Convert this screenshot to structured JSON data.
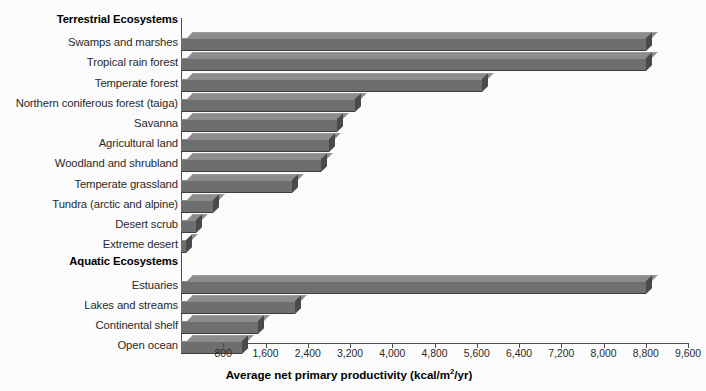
{
  "chart_data": {
    "type": "bar",
    "orientation": "horizontal",
    "title": "",
    "xlabel": "Average net primary productivity (kcal/m²/yr)",
    "ylabel": "",
    "xlim": [
      0,
      9600
    ],
    "xticks": [
      800,
      1600,
      2400,
      3200,
      4000,
      4800,
      5600,
      6400,
      7200,
      8000,
      8800,
      9600
    ],
    "xtick_labels": [
      "800",
      "1,600",
      "2,400",
      "3,200",
      "4,000",
      "4,800",
      "5,600",
      "6,400",
      "7,200",
      "8,000",
      "8,800",
      "9,600"
    ],
    "grid": false,
    "legend": false,
    "bar_color": "#6e6e6e",
    "groups": [
      {
        "name": "Terrestrial Ecosystems",
        "categories": [
          "Swamps and marshes",
          "Tropical rain forest",
          "Temperate forest",
          "Northern coniferous forest (taiga)",
          "Savanna",
          "Agricultural land",
          "Woodland and shrubland",
          "Temperate grassland",
          "Tundra (arctic and alpine)",
          "Desert scrub",
          "Extreme desert"
        ],
        "values": [
          8800,
          8800,
          5700,
          3300,
          2950,
          2800,
          2650,
          2100,
          600,
          280,
          100
        ]
      },
      {
        "name": "Aquatic Ecosystems",
        "categories": [
          "Estuaries",
          "Lakes and streams",
          "Continental shelf",
          "Open ocean"
        ],
        "values": [
          8800,
          2150,
          1450,
          1150
        ]
      }
    ]
  },
  "axis": {
    "title_main": "Average net primary productivity (kcal/m",
    "title_sup": "2",
    "title_tail": "/yr)"
  }
}
